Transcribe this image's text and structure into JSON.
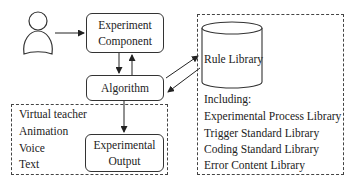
{
  "nodes": {
    "user": {
      "icon": "person-icon"
    },
    "experiment_component": {
      "line1": "Experiment",
      "line2": "Component"
    },
    "algorithm": {
      "label": "Algorithm"
    },
    "rule_library": {
      "label": "Rule Library",
      "icon": "database-cylinder-icon"
    },
    "experimental_output": {
      "line1": "Experimental",
      "line2": "Output"
    }
  },
  "output_group": {
    "items": [
      "Virtual teacher",
      "Animation",
      "Voice",
      "Text"
    ]
  },
  "library_group": {
    "heading": "Including:",
    "items": [
      "Experimental Process Library",
      "Trigger Standard Library",
      "Coding Standard Library",
      "Error Content Library"
    ]
  },
  "edges": [
    {
      "from": "user",
      "to": "experiment_component"
    },
    {
      "from": "experiment_component",
      "to": "algorithm"
    },
    {
      "from": "algorithm",
      "to": "experiment_component"
    },
    {
      "from": "algorithm",
      "to": "rule_library"
    },
    {
      "from": "rule_library",
      "to": "algorithm"
    },
    {
      "from": "algorithm",
      "to": "experimental_output"
    }
  ]
}
